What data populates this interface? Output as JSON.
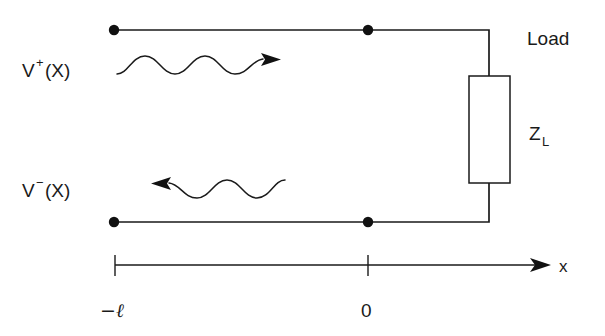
{
  "diagram": {
    "labels": {
      "incident_wave": "V",
      "incident_sup": "+",
      "incident_arg": "(X)",
      "reflected_wave": "V",
      "reflected_sup": "−",
      "reflected_arg": "(X)",
      "load_text": "Load",
      "impedance_symbol": "Z",
      "impedance_subscript": "L",
      "axis_name": "x",
      "tick_left": "−ℓ",
      "tick_right": "0"
    },
    "icons": {
      "incident_arrow": "wave-arrow-right-icon",
      "reflected_arrow": "wave-arrow-left-icon",
      "axis_arrow": "axis-arrow-right-icon",
      "terminal_dots": "terminal-node-dot-icon"
    },
    "colors": {
      "stroke": "#1a1a1a",
      "fill": "#ffffff",
      "dot": "#111111"
    },
    "geometry": {
      "top_conductor_y": 30,
      "bottom_conductor_y": 222,
      "left_terminal_x": 114,
      "right_terminal_x": 368,
      "load_branch_x": 489,
      "axis_y": 265,
      "axis_start_x": 115,
      "axis_end_x": 548
    }
  }
}
